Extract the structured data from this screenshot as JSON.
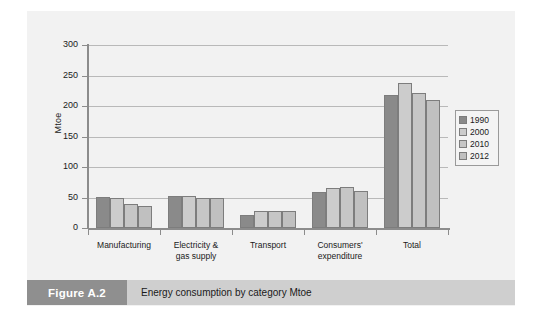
{
  "caption": {
    "tag": "Figure A.2",
    "text": "Energy consumption by category Mtoe"
  },
  "colors": {
    "series_1990": "#8a8a8a",
    "series_2000": "#cccccc",
    "series_2010": "#c6c6c6",
    "series_2012": "#c0c0c0",
    "panel_background": "#f2f2f2",
    "gridline": "#b9b9b9",
    "axis": "#8c8c8c",
    "caption_tag_background": "#8f8f8f",
    "caption_text_background": "#cfcfcf"
  },
  "chart_data": {
    "type": "bar",
    "title": "",
    "xlabel": "",
    "ylabel": "Mtoe",
    "ylim": [
      0,
      300
    ],
    "yticks": [
      0,
      50,
      100,
      150,
      200,
      250,
      300
    ],
    "grid": true,
    "legend_position": "right",
    "categories": [
      "Manufacturing",
      "Electricity & gas supply",
      "Transport",
      "Consumers' expenditure",
      "Total"
    ],
    "category_labels": [
      [
        "Manufacturing"
      ],
      [
        "Electricity &",
        "gas supply"
      ],
      [
        "Transport"
      ],
      [
        "Consumers'",
        "expenditure"
      ],
      [
        "Total"
      ]
    ],
    "series": [
      {
        "name": "1990",
        "values": [
          51,
          52,
          21,
          59,
          218
        ]
      },
      {
        "name": "2000",
        "values": [
          49,
          52,
          28,
          65,
          237
        ]
      },
      {
        "name": "2010",
        "values": [
          39,
          50,
          28,
          67,
          221
        ]
      },
      {
        "name": "2012",
        "values": [
          36,
          50,
          28,
          61,
          210
        ]
      }
    ]
  }
}
